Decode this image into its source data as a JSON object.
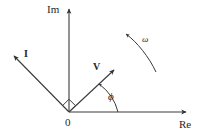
{
  "figure": {
    "background_color": "#ffffff",
    "stroke_color": "#333333",
    "text_color": "#262626",
    "width": 204,
    "height": 138
  },
  "axes": {
    "imaginary": {
      "label": "Im",
      "label_x": 47,
      "label_y": 4,
      "line": {
        "x1": 69,
        "y1": 112,
        "x2": 69,
        "y2": 10
      },
      "arrow_tip": {
        "x": 69,
        "y": 5
      }
    },
    "real": {
      "label": "Re",
      "label_x": 179,
      "label_y": 119,
      "line": {
        "x1": 69,
        "y1": 112,
        "x2": 183,
        "y2": 112
      },
      "arrow_tip": {
        "x": 189,
        "y": 112
      }
    },
    "origin": {
      "label": "0",
      "label_x": 65,
      "label_y": 117,
      "x": 69,
      "y": 112
    }
  },
  "vectors": [
    {
      "name": "current-phasor",
      "label": "I",
      "label_x": 24,
      "label_y": 49,
      "line": {
        "x1": 69,
        "y1": 112,
        "x2": 16,
        "y2": 58
      },
      "arrow_tip": {
        "x": 10,
        "y": 52
      }
    },
    {
      "name": "voltage-phasor",
      "label": "V",
      "label_x": 93,
      "label_y": 62,
      "line": {
        "x1": 69,
        "y1": 112,
        "x2": 111,
        "y2": 73
      },
      "arrow_tip": {
        "x": 118,
        "y": 66
      }
    }
  ],
  "annotations": {
    "phase_angle": {
      "label": "ϕ",
      "label_x": 108,
      "label_y": 91,
      "arc_path": "M 117 112 A 48 48 0 0 0 98 83",
      "arc_arrow_tip": {
        "x": 96,
        "y": 80
      }
    },
    "angular_velocity": {
      "label": "ω",
      "label_x": 142,
      "label_y": 35,
      "arc_path": "M 155 71 C 148 56 137 41 125 33",
      "arc_arrow_tip": {
        "x": 120,
        "y": 30
      }
    },
    "right_angle_marker": {
      "name": "right-angle-marker",
      "points": "69,112 63,106 69,100 75,106"
    }
  }
}
